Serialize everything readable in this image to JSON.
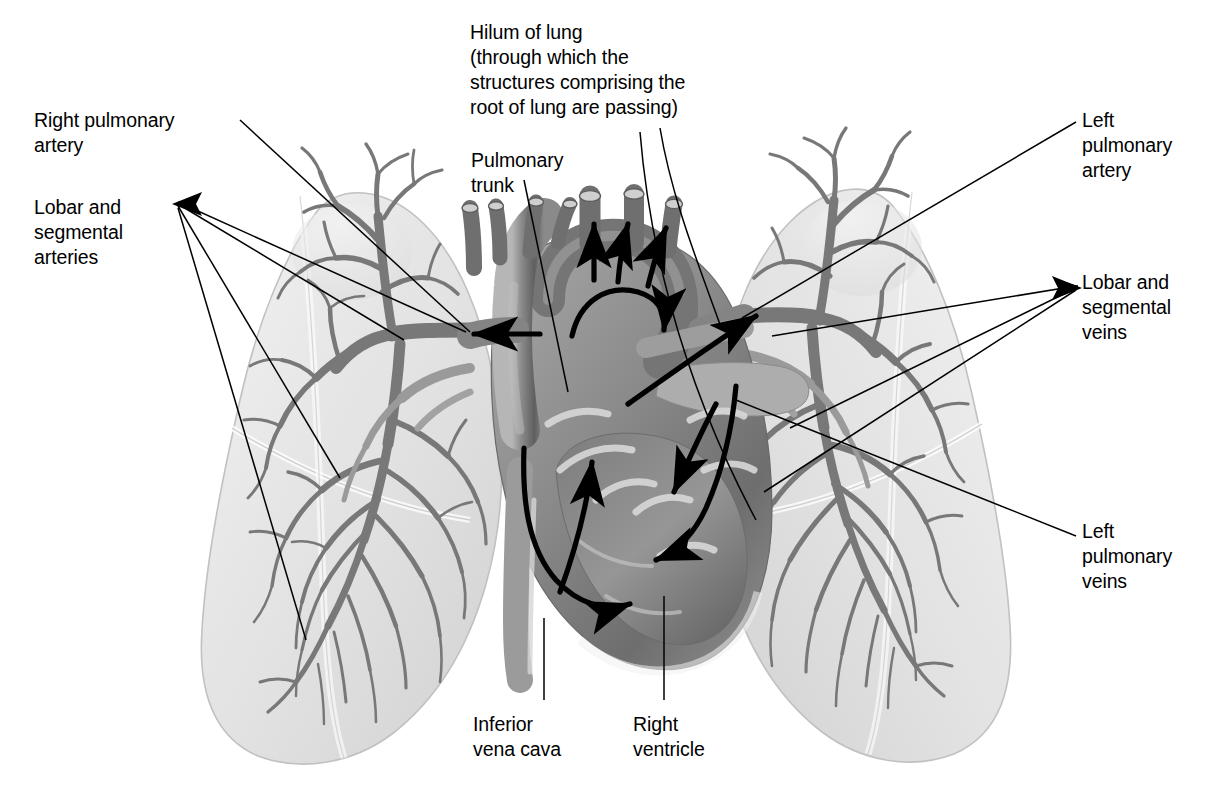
{
  "figure": {
    "style": "grayscale anatomical illustration",
    "background_color": "#ffffff",
    "ink_color": "#000000",
    "lung_fill_color": "#e4e4e4",
    "vessel_color": "#7d7d7d",
    "heart_color": "#8d8d8d",
    "highlight_color": "#d8d8d8"
  },
  "labels": {
    "hilum": {
      "text": "Hilum of lung\n(through which the\nstructures comprising the\nroot of lung are passing)",
      "x": 470,
      "y": 20
    },
    "right_pulmonary_artery": {
      "text": "Right pulmonary\nartery",
      "x": 34,
      "y": 108
    },
    "lobar_segmental_arteries": {
      "text": "Lobar and\nsegmental\narteries",
      "x": 34,
      "y": 195
    },
    "pulmonary_trunk": {
      "text": "Pulmonary\ntrunk",
      "x": 471,
      "y": 148
    },
    "left_pulmonary_artery": {
      "text": "Left\npulmonary\nartery",
      "x": 1082,
      "y": 108
    },
    "lobar_segmental_veins": {
      "text": "Lobar and\nsegmental\nveins",
      "x": 1082,
      "y": 270
    },
    "left_pulmonary_veins": {
      "text": "Left\npulmonary\nveins",
      "x": 1082,
      "y": 519
    },
    "inferior_vena_cava": {
      "text": "Inferior\nvena cava",
      "x": 473,
      "y": 712
    },
    "right_ventricle": {
      "text": "Right\nventricle",
      "x": 633,
      "y": 712
    }
  },
  "anatomy": {
    "structures": [
      "right lung",
      "left lung",
      "heart",
      "pulmonary trunk",
      "right pulmonary artery",
      "left pulmonary artery",
      "lobar and segmental arteries",
      "lobar and segmental veins",
      "left pulmonary veins",
      "inferior vena cava",
      "right ventricle",
      "aortic arch branches",
      "hilum of lung"
    ],
    "flow_arrows": {
      "count": 9,
      "description": "black blood-flow arrows tracing deoxygenated blood from right ventricle through pulmonary trunk into both lungs, and oxygenated blood returning via pulmonary veins"
    }
  }
}
